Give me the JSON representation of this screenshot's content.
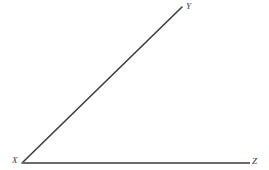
{
  "figure": {
    "background_color": "#ffffff",
    "width": 269,
    "height": 170
  },
  "labels": {
    "vertex": "X",
    "upper_ray_end": "Y",
    "horizontal_ray_end": "Z"
  },
  "geometry": {
    "vertex": {
      "x": 22,
      "y": 163
    },
    "ray_y_end": {
      "x": 182,
      "y": 7
    },
    "ray_z_end": {
      "x": 250,
      "y": 163
    },
    "ray_y_color": "#3c3c42",
    "ray_z_color": "#6b6b72",
    "ray_y_width": 1.6,
    "ray_z_width": 2.0
  },
  "chart_data": {
    "type": "diagram",
    "title": "",
    "shapes": [
      {
        "name": "ray-XY",
        "kind": "line",
        "from": [
          22,
          163
        ],
        "to": [
          182,
          7
        ],
        "color": "#3c3c42",
        "stroke_width": 1.6
      },
      {
        "name": "ray-XZ",
        "kind": "line",
        "from": [
          22,
          163
        ],
        "to": [
          250,
          163
        ],
        "color": "#6b6b72",
        "stroke_width": 2.0
      }
    ],
    "point_labels": [
      {
        "text": "X",
        "at": [
          22,
          163
        ],
        "anchor": "below-left"
      },
      {
        "text": "Y",
        "at": [
          182,
          7
        ],
        "anchor": "right"
      },
      {
        "text": "Z",
        "at": [
          250,
          163
        ],
        "anchor": "right"
      }
    ]
  }
}
